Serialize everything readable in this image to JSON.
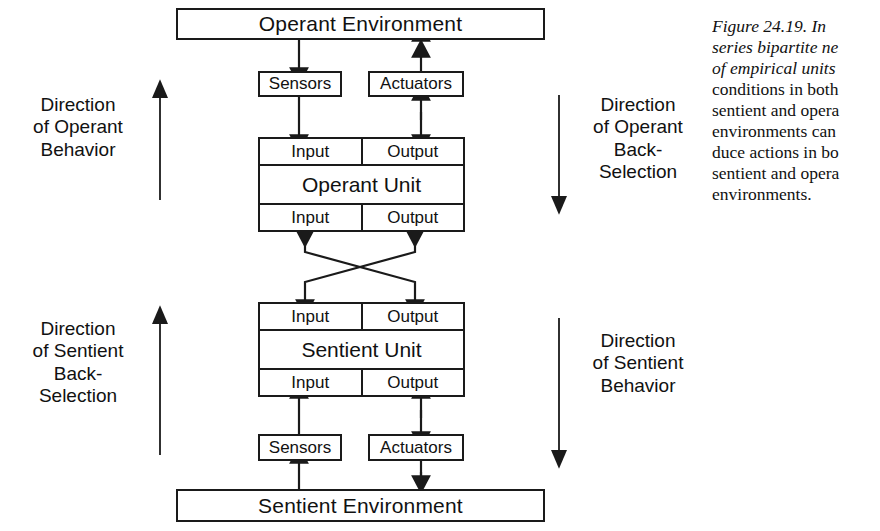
{
  "figure": {
    "id": "Figure 24.19",
    "caption_lead": "Figure 24.19.",
    "caption_lines": [
      "Figure 24.19.  In",
      "series bipartite ne",
      "of empirical units",
      "conditions in both",
      "sentient and opera",
      "environments can",
      "duce actions in bo",
      "sentient and opera",
      "environments."
    ]
  },
  "diagram": {
    "environments": {
      "top": "Operant Environment",
      "bottom": "Sentient Environment"
    },
    "interfaces": {
      "top_sensors": "Sensors",
      "top_actuators": "Actuators",
      "bottom_sensors": "Sensors",
      "bottom_actuators": "Actuators"
    },
    "units": [
      {
        "title": "Operant Unit",
        "top_row": {
          "input": "Input",
          "output": "Output"
        },
        "bottom_row": {
          "input": "Input",
          "output": "Output"
        }
      },
      {
        "title": "Sentient Unit",
        "top_row": {
          "input": "Input",
          "output": "Output"
        },
        "bottom_row": {
          "input": "Input",
          "output": "Output"
        }
      }
    ],
    "side_labels": {
      "left_top": "Direction\nof Operant\nBehavior",
      "left_bottom": "Direction\nof Sentient\nBack-\nSelection",
      "right_top": "Direction\nof Operant\nBack-\nSelection",
      "right_bottom": "Direction\nof Sentient\nBehavior"
    }
  },
  "colors": {
    "ink": "#1a1a1a",
    "paper": "#ffffff"
  }
}
